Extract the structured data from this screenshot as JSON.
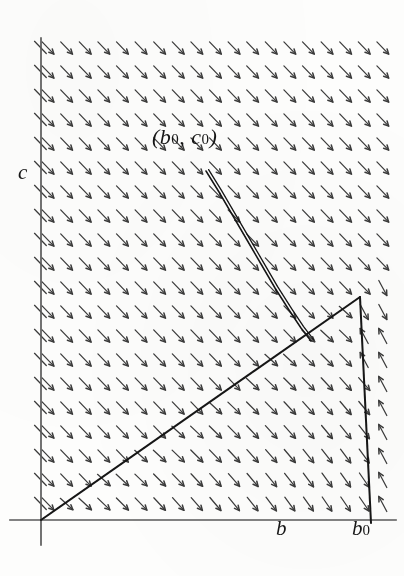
{
  "figure": {
    "title_visible": false,
    "axes": {
      "y_axis_label": "c",
      "x_axis_label": "b",
      "x_axis_tick_label": "b",
      "x_axis_endpoint_label_base": "b",
      "x_axis_endpoint_label_sub": "0",
      "origin_px": [
        41,
        520
      ],
      "y_axis_top_px": [
        41,
        38
      ],
      "y_axis_bottom_px": [
        41,
        545
      ],
      "x_axis_left_px": [
        10,
        520
      ],
      "x_axis_right_px": [
        396,
        520
      ]
    },
    "annotation": {
      "point_label_open": "(",
      "point_label_b": "b",
      "point_label_b_sub": "0",
      "point_label_sep": ", ",
      "point_label_c": "c",
      "point_label_c_sub": "0",
      "point_label_close": ")",
      "point_label_full": "(b0, c0)",
      "position_px": [
        152,
        124
      ]
    },
    "colors": {
      "ink": "#1a1a1a",
      "axis": "#5a5a5a",
      "arrow": "#3b3b3b",
      "paper": "#fdfdfc",
      "curve": "#141414"
    },
    "stroke_widths": {
      "axis": 1.7,
      "separatrix": 2.0,
      "trajectory": 1.5,
      "arrow": 1.25
    }
  },
  "chart_data": {
    "type": "scatter",
    "title": "",
    "subtitle": "",
    "xlabel": "b",
    "ylabel": "c",
    "xlim": [
      0,
      404
    ],
    "ylim": [
      0,
      576
    ],
    "grid": false,
    "legend": null,
    "annotations": [
      {
        "text": "(b0, c0)",
        "x": 152,
        "y": 124
      },
      {
        "text": "c",
        "x": 18,
        "y": 160
      },
      {
        "text": "b",
        "x": 276,
        "y": 516
      },
      {
        "text": "b0",
        "x": 352,
        "y": 516
      }
    ],
    "series": [
      {
        "name": "separatrix-rising",
        "type": "line",
        "points": [
          [
            41,
            520
          ],
          [
            360,
            297
          ]
        ]
      },
      {
        "name": "boundary-descending",
        "type": "line",
        "points": [
          [
            360,
            297
          ],
          [
            371,
            523
          ]
        ]
      },
      {
        "name": "trajectory",
        "type": "line",
        "points": [
          [
            206,
            171
          ],
          [
            219,
            192
          ],
          [
            233,
            216
          ],
          [
            247,
            240
          ],
          [
            261,
            264
          ],
          [
            275,
            288
          ],
          [
            289,
            310
          ],
          [
            301,
            328
          ],
          [
            311,
            341
          ]
        ]
      }
    ],
    "vector_field": {
      "glyph": "arrow",
      "columns": 19,
      "rows": 20,
      "x_start": 48,
      "y_start": 48,
      "x_step": 18.6,
      "y_step": 24.0,
      "arrow_length": 17,
      "notes": "Arrows point down-right above the rising separatrix; below/right of it they tilt toward down-left and flatten near the b-axis."
    }
  }
}
